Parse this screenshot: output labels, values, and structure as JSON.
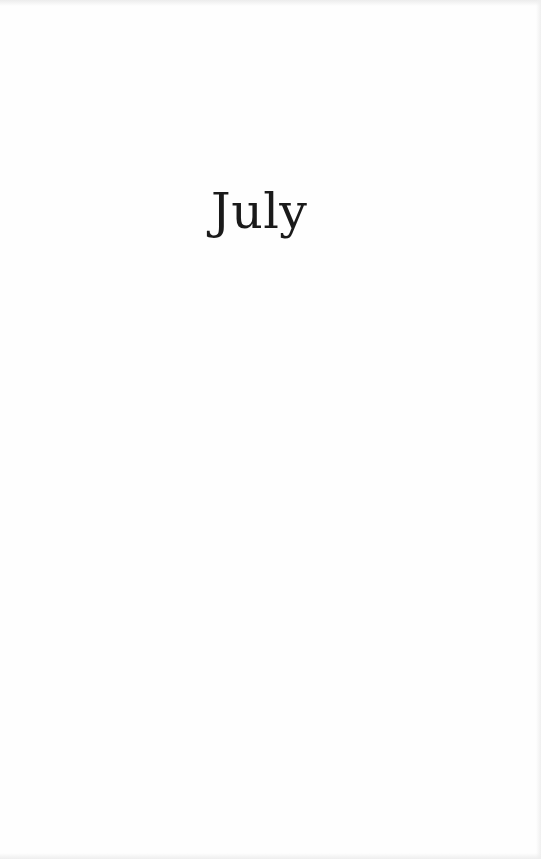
{
  "page": {
    "chapter_title": "July",
    "colors": {
      "background": "#fefefe",
      "text": "#1a1a1a"
    }
  }
}
